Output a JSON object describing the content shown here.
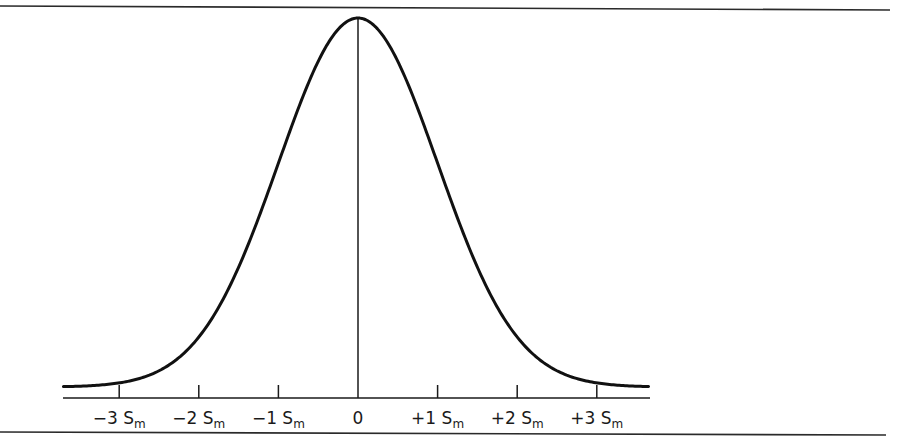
{
  "chart_data": {
    "type": "line",
    "title": "",
    "subtitle": "",
    "xlabel": "",
    "ylabel": "",
    "x_ticks": [
      {
        "value": -3,
        "label": "−3 S",
        "sub": "m"
      },
      {
        "value": -2,
        "label": "−2 S",
        "sub": "m"
      },
      {
        "value": -1,
        "label": "−1 S",
        "sub": "m"
      },
      {
        "value": 0,
        "label": "0",
        "sub": ""
      },
      {
        "value": 1,
        "label": "+1 S",
        "sub": "m"
      },
      {
        "value": 2,
        "label": "+2 S",
        "sub": "m"
      },
      {
        "value": 3,
        "label": "+3 S",
        "sub": "m"
      }
    ],
    "xlim": [
      -3.7,
      3.65
    ],
    "ylim": [
      0,
      1
    ],
    "grid": false,
    "legend": null,
    "series": [
      {
        "name": "normal curve",
        "distribution": "normal",
        "mean": 0,
        "sd": 1,
        "x": [
          -3.7,
          -3,
          -2.5,
          -2,
          -1.5,
          -1,
          -0.5,
          0,
          0.5,
          1,
          1.5,
          2,
          2.5,
          3,
          3.65
        ],
        "y": [
          0.001,
          0.011,
          0.044,
          0.135,
          0.325,
          0.607,
          0.882,
          1.0,
          0.882,
          0.607,
          0.325,
          0.135,
          0.044,
          0.011,
          0.001
        ]
      }
    ],
    "annotations": [
      {
        "type": "vertical-line",
        "x": 0,
        "from": "axis",
        "to": "peak"
      }
    ]
  },
  "colors": {
    "ink": "#1a1a1a",
    "background": "#ffffff"
  }
}
